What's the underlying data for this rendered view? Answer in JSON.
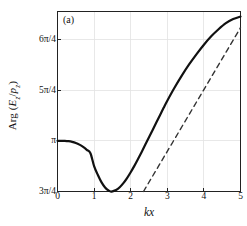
{
  "panel": {
    "tag": "(a)"
  },
  "chart_data": {
    "type": "line",
    "title": "",
    "subtitle": "",
    "panel_label": "(a)",
    "xlabel": "kx",
    "ylabel": "Arg (E_z / p_z)",
    "ylabel_parts": {
      "func": "Arg",
      "open": "(",
      "num": "E",
      "num_sub": "z",
      "slash": "/",
      "den": "p",
      "den_sub": "z",
      "close": ")"
    },
    "xlim": [
      0,
      5
    ],
    "ylim_pi_quarters": [
      3,
      6.55
    ],
    "ylim_label": [
      "3π/4",
      "6.55π/4"
    ],
    "grid": true,
    "legend": "none",
    "xticks": [
      0,
      1,
      2,
      3,
      4,
      5
    ],
    "xticklabels": [
      "0",
      "1",
      "2",
      "3",
      "4",
      "5"
    ],
    "yticks_pi_quarters": [
      3,
      4,
      5,
      6
    ],
    "yticklabels": [
      "3π/4",
      "π",
      "5π/4",
      "6π/4"
    ],
    "series": [
      {
        "name": "phase",
        "style": "solid",
        "color": "#111111",
        "width": 2.2,
        "x": [
          0.0,
          0.1,
          0.2,
          0.3,
          0.4,
          0.5,
          0.6,
          0.7,
          0.8,
          0.9,
          1.0,
          1.1,
          1.2,
          1.3,
          1.4,
          1.45,
          1.5,
          1.6,
          1.7,
          1.8,
          1.9,
          2.0,
          2.1,
          2.2,
          2.3,
          2.4,
          2.5,
          2.6,
          2.7,
          2.8,
          2.9,
          3.0,
          3.2,
          3.4,
          3.6,
          3.8,
          4.0,
          4.2,
          4.4,
          4.6,
          4.8,
          5.0
        ],
        "y_pi_quarters": [
          4.0,
          4.0,
          3.998,
          3.992,
          3.979,
          3.957,
          3.924,
          3.879,
          3.822,
          3.755,
          3.5,
          3.33,
          3.185,
          3.08,
          3.015,
          3.0,
          3.003,
          3.03,
          3.085,
          3.165,
          3.265,
          3.38,
          3.505,
          3.64,
          3.78,
          3.925,
          4.07,
          4.215,
          4.36,
          4.505,
          4.65,
          4.79,
          5.05,
          5.29,
          5.51,
          5.71,
          5.895,
          6.06,
          6.2,
          6.32,
          6.4,
          6.45
        ]
      },
      {
        "name": "asymptote",
        "style": "dashed",
        "color": "#333333",
        "width": 1.4,
        "dash": "5,4",
        "x": [
          2.35,
          5.0
        ],
        "y_pi_quarters": [
          3.0,
          6.23
        ]
      }
    ],
    "annotations": [
      {
        "text": "(a)",
        "x": 0.18,
        "y_pi_quarters": 6.35
      }
    ]
  },
  "axes": {
    "frame_color": "#222222",
    "grid_color": "#e2e2e2",
    "background": "#ffffff"
  }
}
